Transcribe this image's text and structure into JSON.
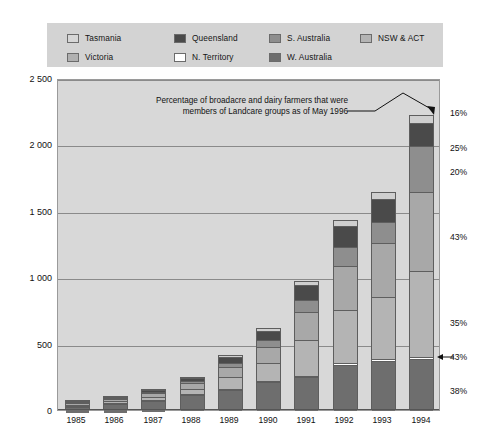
{
  "chart_data": {
    "type": "bar",
    "subtype": "stacked-bar",
    "title": "",
    "subtitle": "",
    "xlabel": "",
    "ylabel": "",
    "annotation": "Percentage of broadacre and dairy farmers that were members of Landcare groups as of May 1996",
    "categories": [
      "1985",
      "1986",
      "1987",
      "1988",
      "1989",
      "1990",
      "1991",
      "1992",
      "1993",
      "1994"
    ],
    "ylim": [
      0,
      2500
    ],
    "yticks": [
      0,
      500,
      1000,
      1500,
      2000,
      2500
    ],
    "ytick_labels": [
      "0",
      "500",
      "1 000",
      "1 500",
      "2 000",
      "2 500"
    ],
    "grid": true,
    "legend_position": "top",
    "right_axis_label": "Percentage of farmers that were members of Landcare groups",
    "right_annotations": [
      {
        "label": "16%",
        "state": "Tasmania",
        "value_pct": 16
      },
      {
        "label": "25%",
        "state": "Queensland",
        "value_pct": 25
      },
      {
        "label": "20%",
        "state": "S. Australia",
        "value_pct": 20
      },
      {
        "label": "43%",
        "state": "Victoria",
        "value_pct": 43
      },
      {
        "label": "35%",
        "state": "NSW & ACT",
        "value_pct": 35
      },
      {
        "label": "43%",
        "state": "N. Territory",
        "value_pct": 43
      },
      {
        "label": "38%",
        "state": "W. Australia",
        "value_pct": 38
      }
    ],
    "series": [
      {
        "name": "W. Australia",
        "color": "#6e6e6e",
        "values": [
          38,
          55,
          78,
          110,
          150,
          205,
          250,
          340,
          375,
          385
        ]
      },
      {
        "name": "N. Territory",
        "color": "#ffffff",
        "values": [
          2,
          3,
          4,
          5,
          6,
          7,
          8,
          9,
          10,
          12
        ]
      },
      {
        "name": "NSW & ACT",
        "color": "#b4b4b4",
        "values": [
          10,
          14,
          22,
          40,
          90,
          140,
          265,
          400,
          470,
          650
        ]
      },
      {
        "name": "Victoria",
        "color": "#a8a8a8",
        "values": [
          12,
          18,
          28,
          45,
          75,
          120,
          210,
          330,
          405,
          590
        ]
      },
      {
        "name": "S. Australia",
        "color": "#8e8e8e",
        "values": [
          5,
          6,
          10,
          18,
          35,
          55,
          95,
          145,
          160,
          350
        ]
      },
      {
        "name": "Queensland",
        "color": "#4a4a4a",
        "values": [
          5,
          7,
          12,
          20,
          45,
          65,
          110,
          160,
          175,
          175
        ]
      },
      {
        "name": "Tasmania",
        "color": "#cfcfcf",
        "values": [
          3,
          4,
          6,
          9,
          14,
          22,
          32,
          45,
          50,
          58
        ]
      }
    ],
    "totals": [
      75,
      107,
      160,
      247,
      415,
      614,
      970,
      1429,
      1645,
      2220
    ]
  },
  "legend": {
    "entries": [
      {
        "label": "Tasmania",
        "color": "#d6d6d6"
      },
      {
        "label": "Queensland",
        "color": "#4a4a4a"
      },
      {
        "label": "S. Australia",
        "color": "#8e8e8e"
      },
      {
        "label": "NSW & ACT",
        "color": "#b4b4b4"
      },
      {
        "label": "Victoria",
        "color": "#b0b0b0"
      },
      {
        "label": "N. Territory",
        "color": "#ffffff"
      },
      {
        "label": "W. Australia",
        "color": "#6e6e6e"
      }
    ]
  },
  "colors": {
    "legend_background": "#d3d3d3",
    "plot_background": "#d8d8d8",
    "gridline": "#8a8a8a",
    "bar_outline": "#5e5e5e",
    "text": "#111111"
  }
}
